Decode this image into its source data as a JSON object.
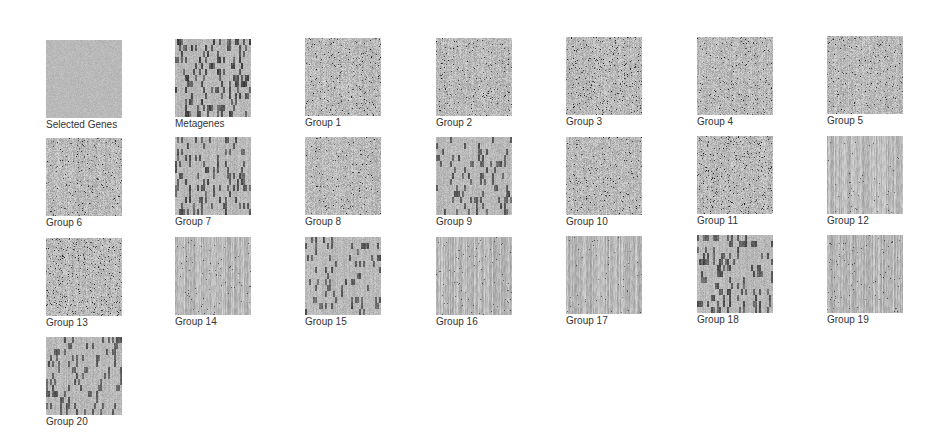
{
  "panels": [
    {
      "label": "Selected Genes",
      "style": "fine",
      "contrast": 0.25,
      "seed": 1,
      "x": 46,
      "y": 40
    },
    {
      "label": "Metagenes",
      "style": "blocky",
      "contrast": 1.0,
      "seed": 2,
      "x": 175,
      "y": 39
    },
    {
      "label": "Group 1",
      "style": "speckle",
      "contrast": 0.55,
      "seed": 3,
      "x": 305,
      "y": 38
    },
    {
      "label": "Group 2",
      "style": "speckle",
      "contrast": 0.5,
      "seed": 4,
      "x": 436,
      "y": 38
    },
    {
      "label": "Group 3",
      "style": "speckle",
      "contrast": 0.8,
      "seed": 5,
      "x": 566,
      "y": 37
    },
    {
      "label": "Group 4",
      "style": "speckle",
      "contrast": 0.45,
      "seed": 6,
      "x": 697,
      "y": 37
    },
    {
      "label": "Group 5",
      "style": "speckle",
      "contrast": 0.4,
      "seed": 7,
      "x": 827,
      "y": 36
    },
    {
      "label": "Group 6",
      "style": "speckle",
      "contrast": 0.45,
      "seed": 8,
      "x": 46,
      "y": 138
    },
    {
      "label": "Group 7",
      "style": "blocky",
      "contrast": 0.85,
      "seed": 9,
      "x": 175,
      "y": 137
    },
    {
      "label": "Group 8",
      "style": "speckle",
      "contrast": 0.35,
      "seed": 10,
      "x": 305,
      "y": 137
    },
    {
      "label": "Group 9",
      "style": "blocky",
      "contrast": 0.7,
      "seed": 11,
      "x": 436,
      "y": 137
    },
    {
      "label": "Group 10",
      "style": "speckle",
      "contrast": 0.45,
      "seed": 12,
      "x": 566,
      "y": 137
    },
    {
      "label": "Group 11",
      "style": "speckle",
      "contrast": 0.8,
      "seed": 13,
      "x": 697,
      "y": 136
    },
    {
      "label": "Group 12",
      "style": "stripe",
      "contrast": 0.5,
      "seed": 14,
      "x": 827,
      "y": 136
    },
    {
      "label": "Group 13",
      "style": "speckle",
      "contrast": 0.8,
      "seed": 15,
      "x": 46,
      "y": 238
    },
    {
      "label": "Group 14",
      "style": "stripe",
      "contrast": 0.6,
      "seed": 16,
      "x": 175,
      "y": 237
    },
    {
      "label": "Group 15",
      "style": "blocky",
      "contrast": 0.7,
      "seed": 17,
      "x": 305,
      "y": 237
    },
    {
      "label": "Group 16",
      "style": "stripe",
      "contrast": 0.55,
      "seed": 18,
      "x": 436,
      "y": 237
    },
    {
      "label": "Group 17",
      "style": "stripe",
      "contrast": 0.45,
      "seed": 19,
      "x": 566,
      "y": 236
    },
    {
      "label": "Group 18",
      "style": "blocky",
      "contrast": 0.9,
      "seed": 20,
      "x": 697,
      "y": 235
    },
    {
      "label": "Group 19",
      "style": "stripe",
      "contrast": 0.6,
      "seed": 21,
      "x": 827,
      "y": 235
    },
    {
      "label": "Group 20",
      "style": "blocky",
      "contrast": 0.65,
      "seed": 22,
      "x": 46,
      "y": 337
    }
  ]
}
